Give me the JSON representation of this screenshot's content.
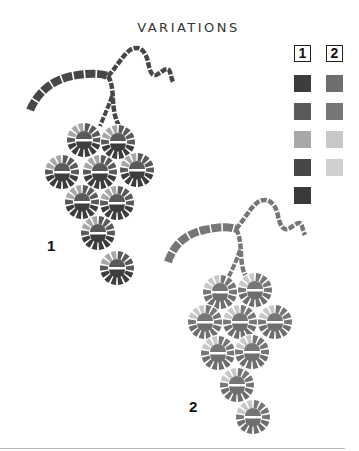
{
  "title": "VARIATIONS",
  "legend": {
    "headers": [
      "1",
      "2"
    ],
    "columns": [
      {
        "id": "1",
        "swatches": [
          "#3d3d3d",
          "#5a5a5a",
          "#a8a8a8",
          "#474747",
          "#3a3a3a"
        ]
      },
      {
        "id": "2",
        "swatches": [
          "#6e6e6e",
          "#767676",
          "#c8c8c8",
          "#cfcfcf"
        ]
      }
    ]
  },
  "clusters": [
    {
      "label": "1",
      "palette": {
        "dark": "#3d3d3d",
        "mid": "#5a5a5a",
        "light": "#a8a8a8",
        "vine": "#474747"
      },
      "berries": [
        [
          84,
          140
        ],
        [
          118,
          142
        ],
        [
          62,
          172
        ],
        [
          100,
          172
        ],
        [
          137,
          170
        ],
        [
          82,
          202
        ],
        [
          117,
          203
        ],
        [
          98,
          233
        ],
        [
          117,
          268
        ]
      ]
    },
    {
      "label": "2",
      "palette": {
        "dark": "#6e6e6e",
        "mid": "#767676",
        "light": "#c8c8c8",
        "vine": "#767676"
      },
      "berries": [
        [
          220,
          292
        ],
        [
          255,
          290
        ],
        [
          205,
          322
        ],
        [
          240,
          322
        ],
        [
          275,
          322
        ],
        [
          218,
          353
        ],
        [
          252,
          352
        ],
        [
          237,
          385
        ],
        [
          253,
          417
        ]
      ]
    }
  ]
}
